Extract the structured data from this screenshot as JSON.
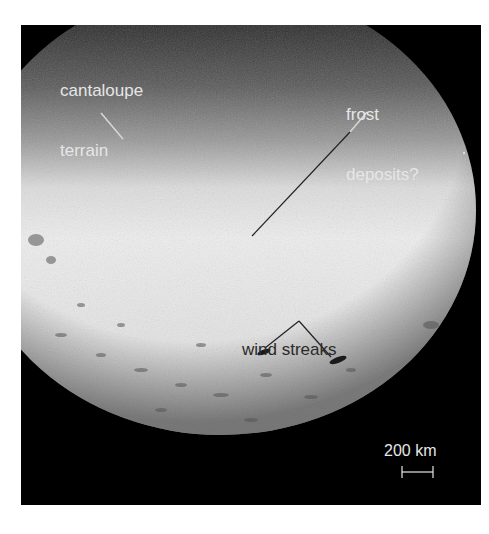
{
  "figure": {
    "background_color": "#000000",
    "page_color": "#ffffff",
    "annotations": [
      {
        "id": "cantaloupe",
        "line1": "cantaloupe",
        "line2": "terrain",
        "color": "#e6e6e6"
      },
      {
        "id": "frost",
        "line1": "frost",
        "line2": "deposits?",
        "color": "#e6e6e6"
      },
      {
        "id": "wind",
        "line1": "wind streaks",
        "color": "#2a2a2a"
      }
    ],
    "scale_bar": {
      "label": "200 km",
      "color": "#e6e6e6"
    }
  }
}
